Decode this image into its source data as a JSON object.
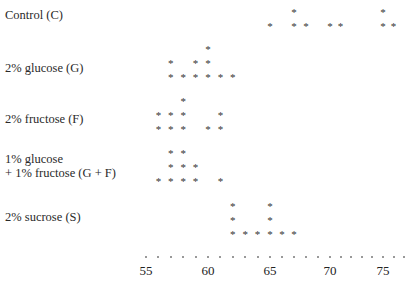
{
  "chart_data": {
    "type": "scatter",
    "subtype": "dot_plot",
    "title": "",
    "xlabel": "",
    "ylabel": "",
    "xlim": [
      54,
      77
    ],
    "x_ticks": [
      55,
      60,
      65,
      70,
      75
    ],
    "marker": "*",
    "grid": false,
    "series": [
      {
        "name": "Control (C)",
        "values": [
          65,
          67,
          67,
          68,
          70,
          71,
          75,
          75,
          76
        ]
      },
      {
        "name": "2% glucose (G)",
        "values": [
          57,
          57,
          58,
          59,
          59,
          60,
          60,
          60,
          61,
          62
        ]
      },
      {
        "name": "2% fructose (F)",
        "values": [
          56,
          56,
          57,
          57,
          58,
          58,
          58,
          60,
          61,
          61
        ]
      },
      {
        "name": "1% glucose\n+ 1% fructose (G + F)",
        "values": [
          56,
          57,
          57,
          57,
          58,
          58,
          58,
          59,
          59,
          61
        ]
      },
      {
        "name": "2% sucrose (S)",
        "values": [
          62,
          62,
          62,
          63,
          64,
          65,
          65,
          65,
          66,
          67
        ]
      }
    ]
  },
  "labels": {
    "control": "Control (C)",
    "glucose": "2% glucose (G)",
    "fructose": "2% fructose (F)",
    "gf_line1": "1% glucose",
    "gf_line2": "+ 1% fructose (G + F)",
    "sucrose": "2% sucrose (S)"
  },
  "axis": {
    "tick_55": "55",
    "tick_60": "60",
    "tick_65": "65",
    "tick_70": "70",
    "tick_75": "75"
  },
  "marker_glyph": "*"
}
